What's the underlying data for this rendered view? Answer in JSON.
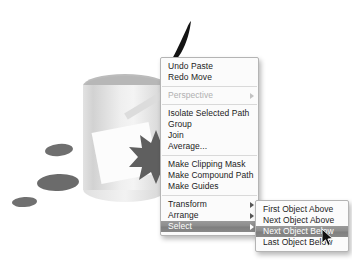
{
  "app": {
    "title": "Vector illustration application context menu",
    "canvas_background": "#ffffff"
  },
  "colors": {
    "menu_background": "#fbfbfb",
    "menu_border": "#b4b4b4",
    "menu_text": "#1b1b1b",
    "menu_disabled_text": "#b0b0b0",
    "highlight_background": "#8a8a8a",
    "highlight_text": "#ffffff",
    "separator": "#d9d9d9",
    "artwork_cylinder": "#e8e8e8",
    "artwork_cylinder_top": "#bcbcbc",
    "artwork_splat": "#6d6d6d",
    "artwork_starburst": "#5f5f5f",
    "artwork_square": "#fcfcfc",
    "artwork_brushstroke": "#1a1a1a"
  },
  "artwork": {
    "cylinder_label": "gray-cylinder-shape",
    "top_ellipse_label": "cylinder-top-ellipse",
    "stick_label": "diagonal-bar-shape",
    "white_square_label": "white-rotated-square",
    "starburst_label": "dark-starburst-shape",
    "splats": [
      {
        "name": "splat-top"
      },
      {
        "name": "splat-middle"
      },
      {
        "name": "splat-bottom"
      }
    ],
    "brushstroke_label": "dark-brush-stroke"
  },
  "context_menu": {
    "name": "object-context-menu",
    "groups": [
      {
        "items": [
          {
            "label": "Undo Paste",
            "disabled": false,
            "submenu": false,
            "selected": false
          },
          {
            "label": "Redo Move",
            "disabled": false,
            "submenu": false,
            "selected": false
          }
        ]
      },
      {
        "items": [
          {
            "label": "Perspective",
            "disabled": true,
            "submenu": true,
            "selected": false
          }
        ]
      },
      {
        "items": [
          {
            "label": "Isolate Selected Path",
            "disabled": false,
            "submenu": false,
            "selected": false
          },
          {
            "label": "Group",
            "disabled": false,
            "submenu": false,
            "selected": false
          },
          {
            "label": "Join",
            "disabled": false,
            "submenu": false,
            "selected": false
          },
          {
            "label": "Average...",
            "disabled": false,
            "submenu": false,
            "selected": false
          }
        ]
      },
      {
        "items": [
          {
            "label": "Make Clipping Mask",
            "disabled": false,
            "submenu": false,
            "selected": false
          },
          {
            "label": "Make Compound Path",
            "disabled": false,
            "submenu": false,
            "selected": false
          },
          {
            "label": "Make Guides",
            "disabled": false,
            "submenu": false,
            "selected": false
          }
        ]
      },
      {
        "items": [
          {
            "label": "Transform",
            "disabled": false,
            "submenu": true,
            "selected": false
          },
          {
            "label": "Arrange",
            "disabled": false,
            "submenu": true,
            "selected": false
          },
          {
            "label": "Select",
            "disabled": false,
            "submenu": true,
            "selected": true
          }
        ]
      }
    ]
  },
  "select_submenu": {
    "name": "select-submenu",
    "items": [
      {
        "label": "First Object Above",
        "selected": false
      },
      {
        "label": "Next Object Above",
        "selected": false
      },
      {
        "label": "Next Object Below",
        "selected": true
      },
      {
        "label": "Last Object Below",
        "selected": false
      }
    ]
  },
  "cursor": {
    "name": "mouse-pointer",
    "x": 322,
    "y": 229
  }
}
